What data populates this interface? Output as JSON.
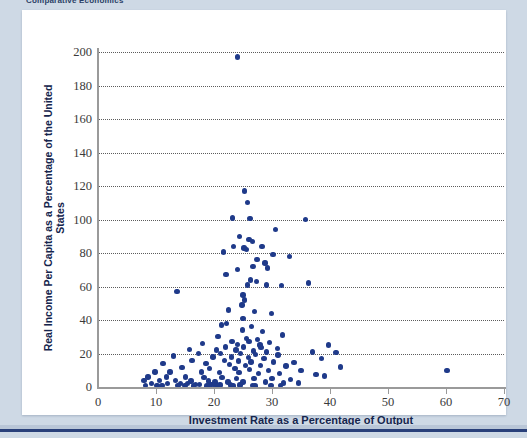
{
  "running_head": "Comparative Economics",
  "figure": {
    "xlabel": "Investment Rate as a Percentage of Output",
    "ylabel": "Real Income Per Capita as a Percentage of the United States"
  },
  "colors": {
    "marker": "#1f3a8a",
    "page_background": "#ced9e5",
    "card_background": "#ffffff",
    "rule": "#29407a",
    "axis": "#9a9a9a",
    "gridline": "#5c5c5c",
    "axis_title": "#15254d"
  },
  "chart_data": {
    "type": "scatter",
    "title": "",
    "xlabel": "Investment Rate as a Percentage of Output",
    "ylabel": "Real Income Per Capita as a Percentage of the United States",
    "xlim": [
      0,
      70
    ],
    "ylim": [
      0,
      200
    ],
    "xticks": [
      0,
      10,
      20,
      30,
      40,
      50,
      60,
      70
    ],
    "yticks": [
      0,
      20,
      40,
      60,
      80,
      100,
      120,
      140,
      160,
      180,
      200
    ],
    "grid": "horizontal-dotted",
    "legend": null,
    "series": [
      {
        "name": "Countries",
        "points": [
          [
            24.0,
            197.0
          ],
          [
            25.3,
            117.0
          ],
          [
            25.8,
            110.0
          ],
          [
            23.2,
            101.0
          ],
          [
            26.2,
            100.5
          ],
          [
            35.8,
            100.0
          ],
          [
            30.6,
            94.0
          ],
          [
            24.4,
            90.0
          ],
          [
            26.0,
            88.0
          ],
          [
            26.6,
            87.0
          ],
          [
            23.4,
            84.0
          ],
          [
            28.3,
            84.0
          ],
          [
            25.2,
            83.0
          ],
          [
            25.6,
            82.0
          ],
          [
            21.6,
            80.5
          ],
          [
            30.2,
            79.0
          ],
          [
            33.0,
            78.0
          ],
          [
            27.4,
            76.0
          ],
          [
            28.8,
            74.0
          ],
          [
            26.7,
            72.0
          ],
          [
            29.2,
            71.0
          ],
          [
            24.0,
            70.0
          ],
          [
            22.1,
            67.0
          ],
          [
            26.3,
            64.0
          ],
          [
            27.3,
            63.0
          ],
          [
            36.3,
            62.0
          ],
          [
            25.8,
            61.0
          ],
          [
            29.1,
            61.0
          ],
          [
            31.6,
            60.5
          ],
          [
            13.6,
            57.0
          ],
          [
            25.0,
            55.0
          ],
          [
            25.3,
            52.0
          ],
          [
            24.8,
            49.0
          ],
          [
            22.5,
            46.0
          ],
          [
            27.0,
            45.0
          ],
          [
            29.9,
            44.0
          ],
          [
            25.0,
            41.0
          ],
          [
            22.2,
            38.0
          ],
          [
            21.3,
            37.0
          ],
          [
            26.5,
            36.0
          ],
          [
            24.9,
            34.0
          ],
          [
            28.4,
            33.0
          ],
          [
            31.8,
            31.0
          ],
          [
            20.7,
            30.0
          ],
          [
            25.6,
            29.0
          ],
          [
            27.5,
            28.5
          ],
          [
            23.1,
            27.0
          ],
          [
            26.0,
            27.0
          ],
          [
            29.6,
            26.5
          ],
          [
            18.0,
            26.0
          ],
          [
            24.1,
            25.5
          ],
          [
            27.9,
            25.0
          ],
          [
            39.7,
            25.0
          ],
          [
            22.0,
            24.0
          ],
          [
            25.1,
            24.0
          ],
          [
            28.1,
            23.5
          ],
          [
            30.9,
            23.0
          ],
          [
            15.8,
            22.5
          ],
          [
            20.4,
            22.0
          ],
          [
            23.8,
            22.0
          ],
          [
            26.8,
            21.5
          ],
          [
            29.0,
            21.0
          ],
          [
            37.0,
            21.0
          ],
          [
            41.0,
            20.5
          ],
          [
            17.3,
            20.0
          ],
          [
            21.1,
            20.0
          ],
          [
            24.6,
            20.0
          ],
          [
            27.2,
            19.5
          ],
          [
            31.0,
            19.0
          ],
          [
            13.0,
            18.5
          ],
          [
            19.8,
            18.0
          ],
          [
            23.0,
            18.0
          ],
          [
            25.9,
            17.5
          ],
          [
            28.6,
            17.0
          ],
          [
            38.5,
            17.0
          ],
          [
            16.2,
            16.0
          ],
          [
            21.8,
            16.0
          ],
          [
            24.2,
            15.5
          ],
          [
            26.4,
            15.0
          ],
          [
            30.3,
            15.0
          ],
          [
            33.8,
            14.5
          ],
          [
            11.2,
            14.0
          ],
          [
            18.6,
            14.0
          ],
          [
            22.7,
            13.5
          ],
          [
            25.4,
            13.0
          ],
          [
            28.0,
            13.0
          ],
          [
            32.4,
            12.5
          ],
          [
            41.8,
            12.0
          ],
          [
            14.5,
            11.5
          ],
          [
            19.2,
            11.0
          ],
          [
            23.6,
            11.0
          ],
          [
            26.1,
            10.5
          ],
          [
            29.4,
            10.0
          ],
          [
            35.0,
            10.0
          ],
          [
            60.2,
            10.0
          ],
          [
            9.8,
            9.0
          ],
          [
            12.4,
            9.0
          ],
          [
            17.8,
            9.0
          ],
          [
            20.9,
            8.5
          ],
          [
            24.3,
            8.5
          ],
          [
            27.7,
            8.0
          ],
          [
            31.3,
            8.0
          ],
          [
            37.6,
            7.5
          ],
          [
            39.0,
            6.5
          ],
          [
            8.6,
            6.0
          ],
          [
            11.8,
            6.0
          ],
          [
            15.1,
            6.0
          ],
          [
            18.3,
            5.5
          ],
          [
            21.4,
            5.5
          ],
          [
            23.9,
            5.0
          ],
          [
            26.9,
            5.0
          ],
          [
            30.0,
            5.0
          ],
          [
            33.2,
            4.5
          ],
          [
            7.9,
            4.0
          ],
          [
            10.6,
            4.0
          ],
          [
            13.4,
            4.0
          ],
          [
            16.0,
            3.5
          ],
          [
            19.0,
            3.5
          ],
          [
            20.2,
            3.0
          ],
          [
            22.4,
            3.0
          ],
          [
            25.0,
            3.0
          ],
          [
            28.9,
            3.0
          ],
          [
            32.0,
            2.5
          ],
          [
            34.6,
            2.5
          ],
          [
            9.2,
            2.0
          ],
          [
            12.0,
            2.0
          ],
          [
            14.2,
            2.0
          ],
          [
            15.4,
            2.0
          ],
          [
            16.8,
            1.5
          ],
          [
            17.5,
            1.5
          ],
          [
            19.5,
            1.5
          ],
          [
            20.0,
            1.5
          ],
          [
            21.0,
            1.2
          ],
          [
            22.8,
            1.2
          ],
          [
            24.5,
            1.2
          ],
          [
            26.6,
            1.0
          ],
          [
            29.8,
            1.0
          ],
          [
            31.5,
            1.0
          ],
          [
            8.2,
            1.0
          ],
          [
            10.2,
            1.0
          ],
          [
            11.0,
            0.8
          ],
          [
            13.8,
            0.8
          ],
          [
            15.0,
            0.8
          ],
          [
            16.5,
            0.6
          ],
          [
            18.8,
            0.6
          ],
          [
            20.6,
            0.6
          ],
          [
            23.3,
            0.5
          ],
          [
            27.1,
            0.5
          ]
        ]
      }
    ]
  }
}
